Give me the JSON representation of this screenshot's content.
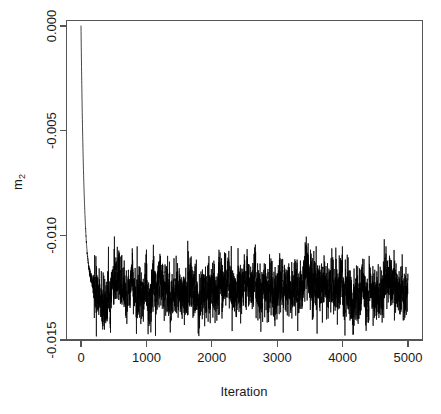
{
  "chart_data": {
    "type": "line",
    "title": "",
    "subtitle": "",
    "xlabel": "Iteration",
    "ylabel": "m2",
    "ylabel_base": "m",
    "ylabel_sub": "2",
    "xlim": [
      0,
      5000
    ],
    "ylim": [
      -0.015,
      0.0
    ],
    "grid": false,
    "legend": null,
    "legend_position": "none",
    "series_color": "#000000",
    "axis_color": "#555555",
    "background": "#ffffff",
    "box_frame": true,
    "xticks": [
      0,
      1000,
      2000,
      3000,
      4000,
      5000
    ],
    "xtick_labels": [
      "0",
      "1000",
      "2000",
      "3000",
      "4000",
      "5000"
    ],
    "yticks": [
      0.0,
      -0.005,
      -0.01,
      -0.015
    ],
    "ytick_labels": [
      "0.000",
      "-0.005",
      "-0.010",
      "-0.015"
    ],
    "ytick_label_rotation": -90,
    "xtick_label_rotation": 0,
    "series": [
      {
        "name": "m2",
        "color": "#000000",
        "n_points": 5000,
        "burn_in_end": 200,
        "stationary_mean": -0.01255,
        "stationary_sd": 0.00068,
        "stationary_min": -0.01485,
        "stationary_max": -0.01005,
        "start_value": 0.0,
        "x": [
          0,
          20,
          40,
          60,
          80,
          100,
          120,
          140,
          160,
          180,
          200
        ],
        "burn_in_values": [
          0.0,
          -0.0013,
          -0.0027,
          -0.0041,
          -0.0054,
          -0.0067,
          -0.0079,
          -0.009,
          -0.0099,
          -0.0108,
          -0.0115
        ]
      }
    ]
  },
  "axes": {
    "x_axis_name": "iteration-axis",
    "y_axis_name": "m2-axis"
  }
}
